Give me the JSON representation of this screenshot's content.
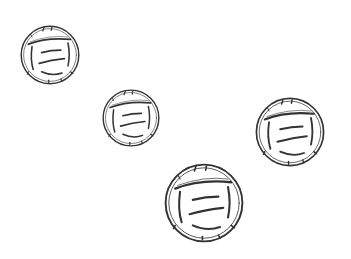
{
  "scene": {
    "background": "#ffffff",
    "stroke_color": "#333333",
    "objects": [
      {
        "type": "ball-sketch",
        "cx": 49.5,
        "cy": 55,
        "r": 30
      },
      {
        "type": "ball-sketch",
        "cx": 131,
        "cy": 118,
        "r": 29
      },
      {
        "type": "ball-sketch",
        "cx": 289.5,
        "cy": 132,
        "r": 35
      },
      {
        "type": "ball-sketch",
        "cx": 203.5,
        "cy": 203,
        "r": 40
      }
    ]
  }
}
